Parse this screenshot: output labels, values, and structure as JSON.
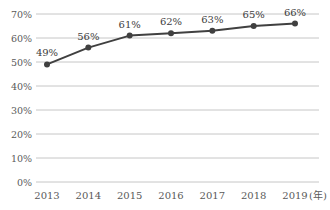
{
  "chart_data": {
    "type": "line",
    "categories": [
      "2013",
      "2014",
      "2015",
      "2016",
      "2017",
      "2018",
      "2019"
    ],
    "values": [
      49,
      56,
      61,
      62,
      63,
      65,
      66
    ],
    "data_labels": [
      "49%",
      "56%",
      "61%",
      "62%",
      "63%",
      "65%",
      "66%"
    ],
    "x_axis_suffix": "(年)",
    "y_ticks": [
      0,
      10,
      20,
      30,
      40,
      50,
      60,
      70
    ],
    "y_tick_labels": [
      "0%",
      "10%",
      "20%",
      "30%",
      "40%",
      "50%",
      "60%",
      "70%"
    ],
    "ylim": [
      0,
      70
    ],
    "grid": true,
    "legend": "none",
    "colors": {
      "line": "#404040",
      "marker": "#404040",
      "grid": "#c6c6c6",
      "axis_text": "#595959",
      "label_text": "#404040",
      "background": "#ffffff"
    }
  }
}
